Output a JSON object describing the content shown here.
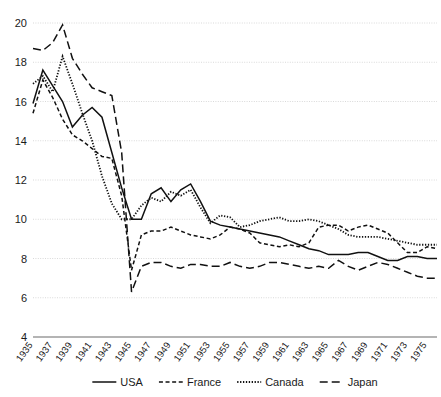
{
  "chart_data": {
    "type": "line",
    "title": "",
    "subtitle": "",
    "xlabel": "",
    "ylabel": "",
    "xlim": [
      1935,
      1976
    ],
    "ylim": [
      4,
      20
    ],
    "grid": true,
    "legend_position": "bottom",
    "ytick_labels": [
      "4",
      "6",
      "8",
      "10",
      "12",
      "14",
      "16",
      "18",
      "20"
    ],
    "ytick_values": [
      4,
      6,
      8,
      10,
      12,
      14,
      16,
      18,
      20
    ],
    "x": [
      1935,
      1936,
      1937,
      1938,
      1939,
      1940,
      1941,
      1942,
      1943,
      1944,
      1945,
      1946,
      1947,
      1948,
      1949,
      1950,
      1951,
      1952,
      1953,
      1954,
      1955,
      1956,
      1957,
      1958,
      1959,
      1960,
      1961,
      1962,
      1963,
      1964,
      1965,
      1966,
      1967,
      1968,
      1969,
      1970,
      1971,
      1972,
      1973,
      1974,
      1975,
      1976
    ],
    "xtick_labels": [
      "1935",
      "1937",
      "1939",
      "1941",
      "1943",
      "1945",
      "1947",
      "1949",
      "1951",
      "1953",
      "1955",
      "1957",
      "1959",
      "1961",
      "1963",
      "1965",
      "1967",
      "1969",
      "1971",
      "1973",
      "1975"
    ],
    "xtick_values": [
      1935,
      1937,
      1939,
      1941,
      1943,
      1945,
      1947,
      1949,
      1951,
      1953,
      1955,
      1957,
      1959,
      1961,
      1963,
      1965,
      1967,
      1969,
      1971,
      1973,
      1975
    ],
    "series": [
      {
        "name": "USA",
        "style": "solid",
        "color": "#111111",
        "dasharray": "",
        "width": 1.5,
        "values": [
          15.9,
          17.6,
          16.8,
          16.0,
          14.7,
          15.3,
          15.7,
          15.2,
          13.4,
          11.6,
          10.0,
          10.0,
          11.3,
          11.6,
          10.9,
          11.5,
          11.8,
          10.9,
          9.9,
          9.7,
          9.6,
          9.5,
          9.4,
          9.3,
          9.2,
          9.1,
          8.9,
          8.7,
          8.5,
          8.4,
          8.2,
          8.2,
          8.2,
          8.3,
          8.3,
          8.1,
          7.9,
          7.9,
          8.1,
          8.1,
          8.0,
          8.0
        ]
      },
      {
        "name": "France",
        "style": "dashed",
        "color": "#111111",
        "dasharray": "4 2.6",
        "width": 1.5,
        "values": [
          15.4,
          17.1,
          16.2,
          15.1,
          14.3,
          14.0,
          13.6,
          13.2,
          13.1,
          11.2,
          7.4,
          9.2,
          9.4,
          9.4,
          9.6,
          9.4,
          9.2,
          9.1,
          9.0,
          9.2,
          9.6,
          9.5,
          9.3,
          8.8,
          8.7,
          8.6,
          8.7,
          8.6,
          8.8,
          9.6,
          9.7,
          9.7,
          9.4,
          9.6,
          9.7,
          9.5,
          9.3,
          8.8,
          8.3,
          8.3,
          8.6,
          8.5
        ]
      },
      {
        "name": "Canada",
        "style": "dotted",
        "color": "#111111",
        "dasharray": "1.3 1.6",
        "width": 1.8,
        "values": [
          16.9,
          17.3,
          16.5,
          18.3,
          16.9,
          15.4,
          14.0,
          12.2,
          10.8,
          10.0,
          10.0,
          10.7,
          11.1,
          10.9,
          11.4,
          11.2,
          11.5,
          10.6,
          9.8,
          10.2,
          10.1,
          9.6,
          9.7,
          9.9,
          10.0,
          10.1,
          9.9,
          9.9,
          10.0,
          9.9,
          9.7,
          9.5,
          9.2,
          9.1,
          9.1,
          9.1,
          9.0,
          8.9,
          8.8,
          8.7,
          8.7,
          8.7
        ]
      },
      {
        "name": "Japan",
        "style": "longdash",
        "color": "#111111",
        "dasharray": "8 4",
        "width": 1.5,
        "values": [
          18.7,
          18.6,
          19.0,
          19.9,
          18.2,
          17.4,
          16.7,
          16.5,
          16.3,
          13.4,
          6.3,
          7.6,
          7.8,
          7.8,
          7.6,
          7.5,
          7.7,
          7.7,
          7.6,
          7.6,
          7.8,
          7.6,
          7.5,
          7.6,
          7.8,
          7.8,
          7.7,
          7.6,
          7.5,
          7.6,
          7.5,
          7.9,
          7.6,
          7.4,
          7.6,
          7.8,
          7.7,
          7.5,
          7.3,
          7.1,
          7.0,
          7.0
        ]
      }
    ]
  },
  "legend": {
    "items": [
      {
        "label": "USA"
      },
      {
        "label": "France"
      },
      {
        "label": "Canada"
      },
      {
        "label": "Japan"
      }
    ]
  }
}
